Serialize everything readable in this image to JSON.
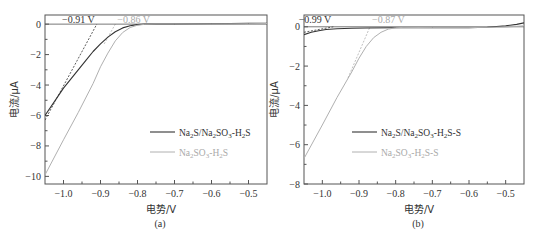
{
  "chart_data": [
    {
      "type": "line",
      "panel": "(a)",
      "xlabel": "电势/V",
      "ylabel": "电流/μA",
      "xlim": [
        -1.05,
        -0.45
      ],
      "ylim": [
        -10.5,
        0.6
      ],
      "xticks": [
        -1.0,
        -0.9,
        -0.8,
        -0.7,
        -0.6,
        -0.5
      ],
      "xtick_labels": [
        "-1.0",
        "-0.9",
        "-0.8",
        "-0.7",
        "-0.6",
        "-0.5"
      ],
      "yticks": [
        0,
        -2,
        -4,
        -6,
        -8,
        -10
      ],
      "ytick_labels": [
        "0",
        "-2",
        "-4",
        "-6",
        "-8",
        "-10"
      ],
      "grid": false,
      "legend_position": "lower right",
      "series": [
        {
          "name": "Na2S/Na2SO3-H2S",
          "color": "#333333",
          "x": [
            -1.05,
            -1.0,
            -0.97,
            -0.94,
            -0.92,
            -0.9,
            -0.88,
            -0.86,
            -0.84,
            -0.82,
            -0.8,
            -0.78,
            -0.75,
            -0.7,
            -0.6,
            -0.5,
            -0.45
          ],
          "y": [
            -6.0,
            -4.2,
            -3.3,
            -2.4,
            -1.8,
            -1.3,
            -0.85,
            -0.5,
            -0.25,
            -0.1,
            -0.03,
            0.0,
            0.0,
            0.0,
            0.02,
            0.05,
            0.06
          ]
        },
        {
          "name": "Na2SO3-H2S",
          "color": "#b0b0b0",
          "x": [
            -1.05,
            -1.0,
            -0.96,
            -0.92,
            -0.9,
            -0.88,
            -0.86,
            -0.84,
            -0.82,
            -0.8,
            -0.78,
            -0.75,
            -0.7,
            -0.6,
            -0.5,
            -0.45
          ],
          "y": [
            -9.9,
            -7.6,
            -5.8,
            -3.9,
            -2.8,
            -1.9,
            -1.1,
            -0.55,
            -0.22,
            -0.07,
            -0.01,
            0.0,
            0.0,
            0.01,
            0.03,
            0.04
          ]
        }
      ],
      "tangents": [
        {
          "color": "#333333",
          "x": [
            -1.05,
            -0.91
          ],
          "y": [
            -6.3,
            0.0
          ],
          "label": "-0.91 V"
        },
        {
          "color": "#b0b0b0",
          "x": [
            -0.89,
            -0.86
          ],
          "y": [
            -1.3,
            0.0
          ],
          "label": "-0.86 V"
        }
      ],
      "annotations": [
        "-0.91 V",
        "-0.86 V"
      ]
    },
    {
      "type": "line",
      "panel": "(b)",
      "xlabel": "电势/V",
      "ylabel": "电流/μA",
      "xlim": [
        -1.05,
        -0.45
      ],
      "ylim": [
        -8.0,
        0.6
      ],
      "xticks": [
        -1.0,
        -0.9,
        -0.8,
        -0.7,
        -0.6,
        -0.5
      ],
      "xtick_labels": [
        "-1.0",
        "-0.9",
        "-0.8",
        "-0.7",
        "-0.6",
        "-0.5"
      ],
      "yticks": [
        0,
        -2,
        -4,
        -6,
        -8
      ],
      "ytick_labels": [
        "0",
        "-2",
        "-4",
        "-6",
        "-8"
      ],
      "grid": false,
      "legend_position": "lower right",
      "series": [
        {
          "name": "Na2S/Na2SO3-H2S-S",
          "color": "#333333",
          "x": [
            -1.05,
            -1.03,
            -1.01,
            -0.99,
            -0.96,
            -0.92,
            -0.88,
            -0.8,
            -0.7,
            -0.6,
            -0.55,
            -0.5,
            -0.47,
            -0.45
          ],
          "y": [
            -0.4,
            -0.28,
            -0.2,
            -0.14,
            -0.1,
            -0.07,
            -0.06,
            -0.05,
            -0.05,
            -0.04,
            -0.02,
            0.05,
            0.12,
            0.2
          ]
        },
        {
          "name": "Na2SO3-H2S-S",
          "color": "#b0b0b0",
          "x": [
            -1.05,
            -1.0,
            -0.96,
            -0.92,
            -0.9,
            -0.88,
            -0.86,
            -0.84,
            -0.82,
            -0.8,
            -0.78,
            -0.7,
            -0.6,
            -0.5,
            -0.45
          ],
          "y": [
            -6.7,
            -5.0,
            -3.6,
            -2.3,
            -1.6,
            -1.0,
            -0.55,
            -0.28,
            -0.12,
            -0.05,
            -0.03,
            -0.04,
            -0.04,
            -0.01,
            0.05
          ]
        }
      ],
      "tangents": [
        {
          "color": "#333333",
          "x": [
            -1.05,
            -0.97
          ],
          "y": [
            -0.28,
            0.0
          ],
          "label": "-0.99 V"
        },
        {
          "color": "#b0b0b0",
          "x": [
            -0.93,
            -0.87
          ],
          "y": [
            -2.6,
            0.0
          ],
          "label": "-0.87 V"
        }
      ],
      "annotations": [
        "-0.99 V",
        "-0.87 V"
      ]
    }
  ],
  "panels": {
    "a": {
      "label": "(a)",
      "xlabel": "电势/V",
      "ylabel": "电流/μA",
      "anno1": "−0.91 V",
      "anno2": "−0.86 V",
      "legend1_main": "Na",
      "legend1_parts": [
        "Na",
        "2",
        "S/Na",
        "2",
        "SO",
        "3",
        "-H",
        "2",
        "S"
      ],
      "legend2_parts": [
        "Na",
        "2",
        "SO",
        "3",
        "-H",
        "2",
        "S"
      ]
    },
    "b": {
      "label": "(b)",
      "xlabel": "电势/V",
      "ylabel": "电流/μA",
      "anno1": "−0.99 V",
      "anno2": "−0.87 V",
      "legend1_parts": [
        "Na",
        "2",
        "S/Na",
        "2",
        "SO",
        "3",
        "-H",
        "2",
        "S-S"
      ],
      "legend2_parts": [
        "Na",
        "2",
        "SO",
        "3",
        "-H",
        "2",
        "S-S"
      ]
    }
  }
}
